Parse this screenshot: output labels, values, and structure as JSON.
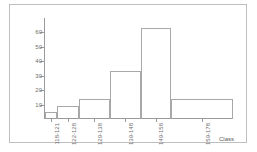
{
  "chart_data": {
    "type": "bar",
    "title": "",
    "subtitle": "",
    "xlabel": "Class",
    "ylabel": "",
    "categories": [
      "118-121",
      "122-128",
      "129-138",
      "139-148",
      "149-158",
      "159-178"
    ],
    "values": [
      5,
      9,
      14,
      33,
      63,
      14
    ],
    "bin_widths": [
      4,
      7,
      10,
      10,
      10,
      20
    ],
    "ylim": [
      0,
      70
    ],
    "yticks": [
      10,
      20,
      30,
      40,
      50,
      60
    ],
    "ytick_labels": [
      "10",
      "20",
      "30",
      "40",
      "50",
      "60"
    ],
    "grid": false,
    "legend": false,
    "bar_style": {
      "fill": "none",
      "edge_color": "#a8a8a8"
    },
    "axis_color": "#9a9a9a",
    "text_color": "#6e6e6e",
    "background": "#ffffff",
    "border_color": "#bfbfbf"
  }
}
